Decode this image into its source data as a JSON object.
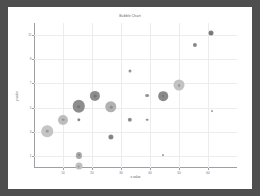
{
  "window": {
    "background_color": "#4e4e4e",
    "panel_color": "#ffffff"
  },
  "chart_data": {
    "type": "scatter",
    "title": "Bubble Chart",
    "xlabel": "x value",
    "ylabel": "y value",
    "grid": true,
    "legend": false,
    "xlim": [
      0,
      70
    ],
    "ylim": [
      0,
      12
    ],
    "xticks": [
      10,
      20,
      30,
      40,
      50,
      60
    ],
    "xticklabels": [
      "10",
      "20",
      "30",
      "40",
      "50",
      "60"
    ],
    "yticks": [
      1,
      3,
      5,
      7,
      9,
      11
    ],
    "yticklabels": [
      "1",
      "3",
      "5",
      "7",
      "9",
      "11"
    ],
    "marker_color_light": "#c9c9c9",
    "marker_color_dark": "#8a8a8a",
    "points": [
      {
        "x": 4.5,
        "y": 3.05,
        "size": 11.5,
        "shade": "#c5c5c5"
      },
      {
        "x": 10.0,
        "y": 4.0,
        "size": 10.0,
        "shade": "#bdbdbd"
      },
      {
        "x": 15.5,
        "y": 5.1,
        "size": 12.5,
        "shade": "#8d8d8d"
      },
      {
        "x": 15.5,
        "y": 4.0,
        "size": 3.4,
        "shade": "#8f8f8f"
      },
      {
        "x": 15.5,
        "y": 1.05,
        "size": 6.2,
        "shade": "#a8a8a8"
      },
      {
        "x": 15.5,
        "y": 0.15,
        "size": 7.0,
        "shade": "#c0c0c0"
      },
      {
        "x": 21.0,
        "y": 5.95,
        "size": 10.2,
        "shade": "#8d8d8d"
      },
      {
        "x": 26.5,
        "y": 5.05,
        "size": 11.5,
        "shade": "#b2b2b2"
      },
      {
        "x": 26.5,
        "y": 2.55,
        "size": 5.2,
        "shade": "#8a8a8a"
      },
      {
        "x": 33.0,
        "y": 8.05,
        "size": 3.0,
        "shade": "#9a9a9a"
      },
      {
        "x": 33.0,
        "y": 4.0,
        "size": 4.4,
        "shade": "#8f8f8f"
      },
      {
        "x": 39.0,
        "y": 6.0,
        "size": 3.8,
        "shade": "#9a9a9a"
      },
      {
        "x": 39.0,
        "y": 4.0,
        "size": 2.6,
        "shade": "#9f9f9f"
      },
      {
        "x": 44.5,
        "y": 5.95,
        "size": 9.6,
        "shade": "#8a8a8a"
      },
      {
        "x": 44.5,
        "y": 1.1,
        "size": 2.0,
        "shade": "#a5a5a5"
      },
      {
        "x": 50.0,
        "y": 6.85,
        "size": 11.0,
        "shade": "#c2c2c2"
      },
      {
        "x": 55.5,
        "y": 10.2,
        "size": 4.2,
        "shade": "#8a8a8a"
      },
      {
        "x": 61.0,
        "y": 11.15,
        "size": 5.0,
        "shade": "#7e7e7e"
      },
      {
        "x": 61.5,
        "y": 4.7,
        "size": 2.0,
        "shade": "#a8a8a8"
      }
    ]
  }
}
